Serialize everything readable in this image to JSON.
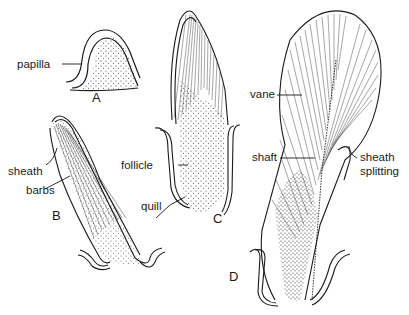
{
  "figure": {
    "stages": [
      {
        "id": "A",
        "label": "A"
      },
      {
        "id": "B",
        "label": "B"
      },
      {
        "id": "C",
        "label": "C"
      },
      {
        "id": "D",
        "label": "D"
      }
    ],
    "labels": {
      "papilla": "papilla",
      "sheath": "sheath",
      "barbs": "barbs",
      "quill": "quill",
      "follicle": "follicle",
      "vane": "vane",
      "shaft": "shaft",
      "sheath_splitting_1": "sheath",
      "sheath_splitting_2": "splitting"
    },
    "colors": {
      "ink": "#1a1a1a",
      "background": "#ffffff"
    }
  }
}
